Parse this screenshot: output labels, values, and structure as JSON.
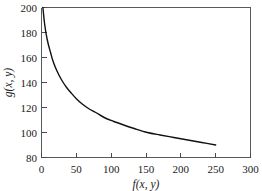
{
  "chart_data": {
    "type": "line",
    "title": "",
    "xlabel": "f(x, y)",
    "ylabel": "g(x, y)",
    "xlim": [
      0,
      300
    ],
    "ylim": [
      80,
      200
    ],
    "xticks": [
      0,
      50,
      100,
      150,
      200,
      250,
      300
    ],
    "yticks": [
      80,
      100,
      120,
      140,
      160,
      180,
      200
    ],
    "xtick_labels": [
      "0",
      "50",
      "100",
      "150",
      "200",
      "250",
      "300"
    ],
    "ytick_labels": [
      "80",
      "100",
      "120",
      "140",
      "160",
      "180",
      "200"
    ],
    "grid": false,
    "legend": null,
    "series": [
      {
        "name": "g vs f",
        "color": "#111111",
        "x": [
          2,
          4,
          6,
          8,
          10,
          13,
          16,
          20,
          25,
          30,
          36,
          42,
          50,
          58,
          68,
          78,
          90,
          103,
          118,
          134,
          152,
          170,
          190,
          210,
          230,
          250
        ],
        "y": [
          200,
          189,
          181,
          175,
          170,
          164,
          158,
          152,
          146,
          141,
          136,
          132,
          127,
          123,
          119,
          116,
          112,
          109,
          106,
          103,
          100,
          98,
          96,
          94,
          92,
          90
        ]
      }
    ]
  },
  "axes": {
    "x_axis_name": "f(x, y)",
    "y_axis_name": "g(x, y)"
  }
}
